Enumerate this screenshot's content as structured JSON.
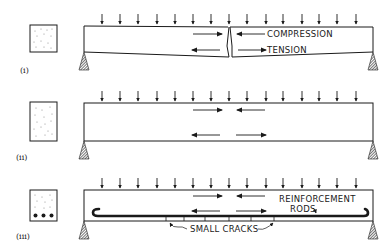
{
  "figure": {
    "panels": [
      {
        "id": "i",
        "label": "(i)",
        "section": "plain concrete",
        "annotations": {
          "compression": "COMPRESSION",
          "tension": "TENSION"
        },
        "features": [
          "loaded beam",
          "central crack",
          "compression arrows at top",
          "tension arrows at bottom"
        ]
      },
      {
        "id": "ii",
        "label": "(ii)",
        "section": "plain concrete (deeper)",
        "features": [
          "loaded beam",
          "compression arrows at top",
          "tension arrows at bottom"
        ]
      },
      {
        "id": "iii",
        "label": "(iii)",
        "section": "reinforced concrete with 3 bars",
        "annotations": {
          "rods_line1": "REINFORCEMENT",
          "rods_line2": "RODS",
          "cracks": "SMALL CRACKS"
        },
        "features": [
          "loaded beam",
          "reinforcement rod with hooked ends",
          "small cracks at bottom"
        ]
      }
    ],
    "load_arrows_per_beam": 15,
    "colors": {
      "ink": "#1a1a1a",
      "background": "#ffffff"
    }
  }
}
